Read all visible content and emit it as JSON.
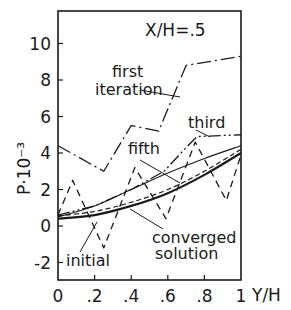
{
  "chart_data": {
    "type": "line",
    "title": "X/H=.5",
    "xlabel": "Y/H",
    "ylabel": "P·10⁻³",
    "xlim": [
      0,
      1
    ],
    "ylim": [
      -3.5,
      11.5
    ],
    "xticks": [
      0,
      0.2,
      0.4,
      0.6,
      0.8,
      1
    ],
    "xtick_labels": [
      "0",
      ".2",
      ".4",
      ".6",
      ".8",
      "1"
    ],
    "yticks": [
      -2,
      0,
      2,
      4,
      6,
      8,
      10
    ],
    "ytick_labels": [
      "-2",
      "0",
      "2",
      "4",
      "6",
      "8",
      "10"
    ],
    "grid": false,
    "series": [
      {
        "name": "first iteration",
        "style": "dashdot",
        "x": [
          0,
          0.25,
          0.4,
          0.55,
          0.7,
          1.0
        ],
        "y": [
          4.4,
          3.0,
          5.5,
          5.2,
          8.8,
          9.3
        ]
      },
      {
        "name": "third",
        "style": "dashdotdot",
        "x": [
          0,
          0.2,
          0.4,
          0.58,
          0.7,
          0.76,
          1.0
        ],
        "y": [
          0.6,
          1.1,
          2.0,
          3.0,
          4.3,
          4.9,
          5.0
        ]
      },
      {
        "name": "fifth",
        "style": "solid-thin",
        "x": [
          0,
          0.2,
          0.4,
          0.6,
          0.8,
          1.0
        ],
        "y": [
          0.5,
          1.1,
          2.0,
          2.9,
          3.7,
          4.4
        ]
      },
      {
        "name": "initial",
        "style": "dashed",
        "x": [
          0,
          0.08,
          0.25,
          0.42,
          0.59,
          0.75,
          0.92,
          1.0
        ],
        "y": [
          0.6,
          2.5,
          -1.2,
          3.2,
          0.4,
          4.6,
          1.4,
          3.9
        ]
      },
      {
        "name": "converged solution",
        "style": "solid-thick",
        "x": [
          0,
          0.2,
          0.4,
          0.6,
          0.8,
          1.0
        ],
        "y": [
          0.4,
          0.6,
          1.1,
          1.8,
          2.8,
          4.0
        ]
      },
      {
        "name": "converged (dashed companion)",
        "style": "dashed-fine",
        "x": [
          0,
          0.2,
          0.4,
          0.6,
          0.8,
          1.0
        ],
        "y": [
          0.55,
          0.8,
          1.3,
          2.0,
          3.0,
          4.2
        ]
      }
    ],
    "annotations": [
      {
        "text": "first",
        "series": "first iteration"
      },
      {
        "text": "iteration",
        "series": "first iteration"
      },
      {
        "text": "third",
        "series": "third"
      },
      {
        "text": "fifth",
        "series": "fifth"
      },
      {
        "text": "initial",
        "series": "initial"
      },
      {
        "text": "converged",
        "series": "converged solution"
      },
      {
        "text": "solution",
        "series": "converged solution"
      }
    ]
  }
}
